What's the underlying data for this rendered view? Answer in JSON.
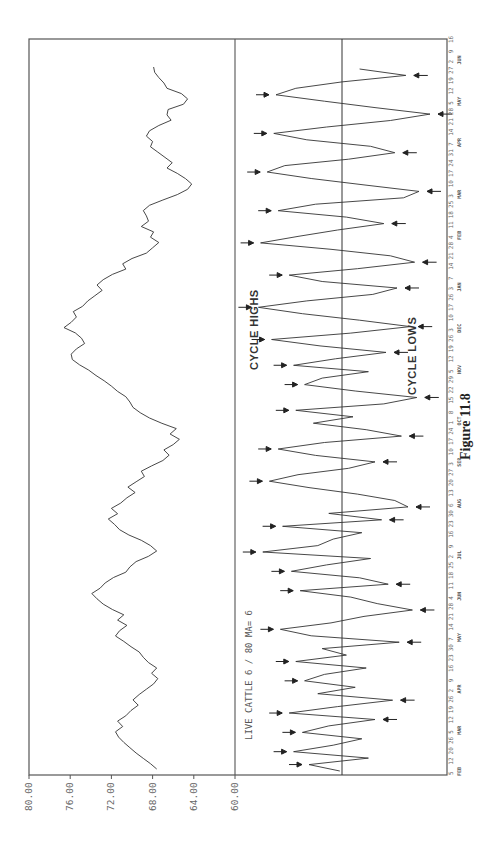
{
  "chart_data": {
    "type": "line",
    "orientation": "rotated-90-ccw (time runs bottom-to-top of page)",
    "title": "LIVE CATTLE   6 / 80  MA= 6",
    "caption": "Figure 11.8",
    "ylabel": "",
    "xlabel": "",
    "ylim": [
      60,
      80
    ],
    "yticks": [
      "80.00",
      "76.00",
      "72.00",
      "68.00",
      "64.00",
      "60.00"
    ],
    "grid": false,
    "legend": null,
    "annotations": [
      "CYCLE HIGHS",
      "CYCLE LOWS"
    ],
    "x_tick_days": [
      "5",
      "12",
      "20",
      "26",
      "5",
      "12",
      "19",
      "26",
      "2",
      "9",
      "16",
      "23",
      "30",
      "7",
      "14",
      "21",
      "28",
      "4",
      "11",
      "18",
      "25",
      "2",
      "9",
      "16",
      "23",
      "30",
      "6",
      "13",
      "20",
      "27",
      "3",
      "10",
      "17",
      "24",
      "1",
      "8",
      "15",
      "22",
      "29",
      "5",
      "12",
      "19",
      "26",
      "3",
      "10",
      "17",
      "26",
      "3",
      "7",
      "14",
      "21",
      "28",
      "4",
      "11",
      "18",
      "25",
      "3",
      "10",
      "17",
      "24",
      "31",
      "7",
      "14",
      "21",
      "28",
      "5",
      "12",
      "19",
      "27",
      "2",
      "9",
      "16"
    ],
    "x_month_labels": [
      "FEB",
      "MAR",
      "APR",
      "MAY",
      "JUN",
      "JUL",
      "AUG",
      "SEP",
      "OCT",
      "NOV",
      "DEC",
      "JAN",
      "FEB",
      "MAR",
      "APR",
      "MAY",
      "JUN"
    ],
    "series": [
      {
        "name": "Live Cattle price",
        "panel": "upper",
        "values": [
          67.6,
          68.2,
          68.9,
          69.6,
          70.2,
          70.8,
          71.3,
          71.6,
          70.9,
          71.4,
          70.6,
          70.1,
          69.4,
          69.9,
          69.3,
          68.6,
          67.9,
          67.5,
          68.1,
          67.6,
          68.4,
          68.9,
          69.3,
          70.1,
          70.8,
          71.6,
          71.2,
          70.5,
          71.4,
          70.8,
          71.9,
          72.8,
          73.4,
          73.9,
          73.1,
          72.6,
          71.8,
          70.6,
          70.2,
          69.6,
          68.4,
          67.6,
          68.2,
          69.1,
          70.3,
          71.2,
          71.7,
          72.3,
          71.4,
          72.0,
          71.1,
          70.5,
          69.7,
          70.4,
          69.6,
          68.8,
          69.1,
          68.1,
          67.0,
          66.4,
          66.9,
          66.0,
          65.4,
          66.3,
          65.7,
          67.1,
          68.3,
          69.2,
          69.9,
          70.2,
          70.6,
          71.4,
          72.0,
          72.7,
          73.5,
          74.2,
          75.1,
          75.8,
          75.9,
          75.4,
          74.6,
          74.9,
          75.5,
          76.6,
          75.9,
          75.4,
          75.7,
          74.8,
          74.3,
          73.6,
          72.9,
          73.4,
          72.8,
          71.9,
          70.6,
          70.9,
          70.0,
          68.6,
          68.0,
          67.4,
          68.2,
          67.9,
          69.1,
          68.4,
          68.6,
          68.9,
          68.3,
          67.0,
          65.6,
          64.6,
          64.2,
          64.8,
          65.6,
          66.6,
          66.1,
          66.8,
          67.5,
          68.2,
          68.0,
          68.6,
          68.3,
          67.4,
          66.2,
          66.6,
          66.5,
          65.0,
          64.6,
          65.2,
          66.6,
          66.9,
          67.4,
          67.8,
          67.9
        ]
      },
      {
        "name": "Oscillator (6/80, MA=6)",
        "panel": "lower",
        "values": [
          0.1,
          1.5,
          -1.2,
          2.2,
          0.4,
          -0.9,
          1.8,
          0.6,
          -1.5,
          2.4,
          0.2,
          -2.3,
          1.1,
          -0.6,
          1.7,
          0.8,
          -1.1,
          2.1,
          -0.2,
          0.9,
          -2.6,
          1.4,
          2.8,
          0.5,
          -1.0,
          -3.2,
          -1.6,
          -0.4,
          1.9,
          -2.1,
          -0.8,
          2.3,
          0.7,
          -1.3,
          3.6,
          1.1,
          0.4,
          -0.9,
          2.7,
          -1.8,
          0.6,
          -3.0,
          -2.4,
          -0.7,
          1.5,
          3.3,
          2.0,
          -0.3,
          -1.5,
          1.2,
          2.9,
          0.8,
          -2.7,
          -1.1,
          1.3,
          -0.5,
          2.1,
          -1.9,
          -3.4,
          -0.6,
          1.7,
          0.9,
          -1.2,
          2.2,
          0.3,
          -2.0,
          1.0,
          3.2,
          -0.4,
          -3.1,
          -0.8,
          1.8,
          3.8,
          1.6,
          -1.4,
          -2.5,
          0.9,
          2.4,
          -0.7,
          -3.3,
          -2.2,
          0.5,
          3.7,
          2.0,
          0.2,
          -1.9,
          -0.2,
          2.9,
          1.2,
          -2.8,
          -3.5,
          -1.0,
          1.4,
          3.4,
          2.6,
          -0.3,
          -2.4,
          -1.3,
          1.6,
          3.1,
          0.7,
          -2.2,
          -4.0,
          -1.5,
          0.8,
          3.0,
          2.1,
          0.0,
          -2.9,
          -0.8
        ]
      }
    ],
    "cycle_high_marker_count": 24,
    "cycle_low_marker_count": 20
  },
  "labels": {
    "title": "LIVE CATTLE   6 / 80  MA= 6",
    "cycle_highs": "CYCLE HIGHS",
    "cycle_lows": "CYCLE LOWS",
    "caption": "Figure 11.8"
  }
}
